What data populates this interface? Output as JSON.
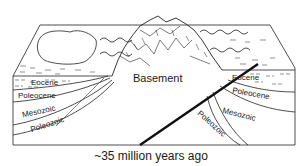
{
  "diagram": {
    "type": "geologic-block-diagram",
    "caption": "~35 million years ago",
    "center_label": "Basement",
    "left_strata": [
      "Eocene",
      "Paleocene",
      "Mesozoic",
      "Paleozoic"
    ],
    "right_strata": [
      "Eocene",
      "Paleocene",
      "Mesozoic",
      "Paleozoic"
    ],
    "colors": {
      "line": "#222222",
      "fault": "#111111",
      "background": "#ffffff"
    }
  },
  "labels": {
    "left_eocene": "Eocene",
    "left_paleocene": "Poleocene",
    "left_mesozoic": "Mesozoic",
    "left_paleozoic": "Poleozoic",
    "right_eocene": "Eocene",
    "right_paleocene": "Poleocene",
    "right_mesozoic": "Mesozoic",
    "right_paleozoic": "Poleozoic",
    "basement": "Basement",
    "caption": "~35 million years ago"
  }
}
